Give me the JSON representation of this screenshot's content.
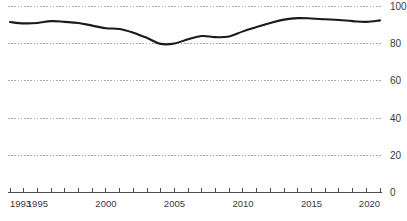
{
  "chart_data": {
    "type": "line",
    "title": "",
    "subtitle": "",
    "xlabel": "",
    "ylabel": "",
    "xlim": [
      1993,
      2020
    ],
    "ylim": [
      0,
      100
    ],
    "grid": true,
    "legend": false,
    "legend_position": "none",
    "y_ticks": [
      100,
      80,
      60,
      40,
      20,
      0
    ],
    "y_tick_labels": [
      "100",
      "80",
      "60",
      "40",
      "20",
      "0"
    ],
    "x_ticks": [
      1993,
      1994,
      1995,
      1996,
      1997,
      1998,
      1999,
      2000,
      2001,
      2002,
      2003,
      2004,
      2005,
      2006,
      2007,
      2008,
      2009,
      2010,
      2011,
      2012,
      2013,
      2014,
      2015,
      2016,
      2017,
      2018,
      2019,
      2020
    ],
    "x_tick_labels": [
      "1993",
      "1995",
      "2000",
      "2005",
      "2010",
      "2015",
      "2020"
    ],
    "x_labeled_ticks": [
      1993,
      1995,
      2000,
      2005,
      2010,
      2015,
      2020
    ],
    "line_color": "#1a1a1a",
    "grid_color": "#a8a8a8",
    "axis_color": "#4d4d4d",
    "x": [
      1993,
      1994,
      1995,
      1996,
      1997,
      1998,
      1999,
      2000,
      2001,
      2002,
      2003,
      2004,
      2005,
      2006,
      2007,
      2008,
      2009,
      2010,
      2011,
      2012,
      2013,
      2014,
      2015,
      2016,
      2017,
      2018,
      2019,
      2020
    ],
    "values": [
      91.5,
      90.8,
      91.0,
      92.0,
      91.6,
      91.0,
      89.6,
      88.2,
      87.8,
      85.8,
      83.0,
      79.8,
      80.0,
      82.3,
      84.0,
      83.4,
      83.8,
      86.5,
      88.8,
      91.0,
      92.8,
      93.6,
      93.4,
      93.0,
      92.6,
      92.0,
      91.6,
      92.4
    ],
    "series": [
      {
        "name": "series-1",
        "values": [
          91.5,
          90.8,
          91.0,
          92.0,
          91.6,
          91.0,
          89.6,
          88.2,
          87.8,
          85.8,
          83.0,
          79.8,
          80.0,
          82.3,
          84.0,
          83.4,
          83.8,
          86.5,
          88.8,
          91.0,
          92.8,
          93.6,
          93.4,
          93.0,
          92.6,
          92.0,
          91.6,
          92.4
        ]
      }
    ]
  }
}
